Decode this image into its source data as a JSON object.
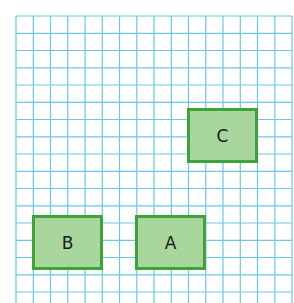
{
  "grid": {
    "origin_x": 16,
    "origin_y": 16,
    "cell": 17.25,
    "cols": 16,
    "rows": 17,
    "line_color": "#6cc6e4"
  },
  "colors": {
    "fill": "#a9d69c",
    "border": "#3fa33a"
  },
  "shapes": [
    {
      "label": "C",
      "x": 187,
      "y": 108,
      "w": 71,
      "h": 55
    },
    {
      "label": "B",
      "x": 32,
      "y": 215,
      "w": 71,
      "h": 55
    },
    {
      "label": "A",
      "x": 135,
      "y": 215,
      "w": 71,
      "h": 55
    }
  ]
}
